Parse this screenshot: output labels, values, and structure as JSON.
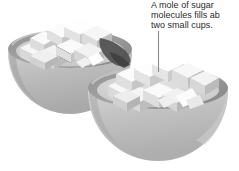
{
  "figure": {
    "background_color": "#ffffff",
    "annotation": {
      "lines": [
        "A mole of sugar",
        "molecules fills ab",
        "two small cups."
      ],
      "full_text": "A mole of sugar molecules fills ab two small cups.",
      "text_color": "#2b2b2b",
      "leader_line_color": "#8a8a8a"
    },
    "objects": {
      "left_cup": {
        "label": "left small cup",
        "rim_color": "#9a9a9a",
        "bowl_color": "#b8b8b8",
        "interior_color": "#d2d2d2"
      },
      "right_cup": {
        "label": "right small cup",
        "rim_color": "#9a9a9a",
        "bowl_color": "#bdbdbd",
        "interior_color": "#d6d6d6"
      },
      "sugar_cubes": {
        "label": "sugar cubes",
        "top_face_color": "#f7f7f7",
        "left_face_color": "#dcdcdc",
        "right_face_color": "#c2c2c2"
      },
      "shadow": {
        "label": "contact shadow between cups",
        "color": "#4a4a4a"
      }
    }
  }
}
